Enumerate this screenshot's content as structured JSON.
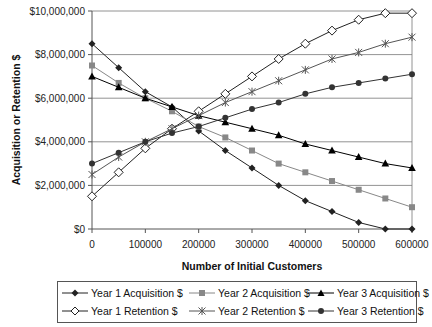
{
  "chart_data": {
    "type": "line",
    "title": "",
    "xlabel": "Number of Initial Customers",
    "ylabel": "Acquisition or Retention $",
    "x": [
      0,
      50000,
      100000,
      150000,
      200000,
      250000,
      300000,
      350000,
      400000,
      450000,
      500000,
      550000,
      600000
    ],
    "x_tick_labels": [
      "0",
      "100000",
      "200000",
      "300000",
      "400000",
      "500000",
      "600000"
    ],
    "y_tick_labels": [
      "$0",
      "$2,000,000",
      "$4,000,000",
      "$6,000,000",
      "$8,000,000",
      "$10,000,000"
    ],
    "ylim": [
      0,
      10000000
    ],
    "xlim": [
      0,
      600000
    ],
    "grid": "horizontal",
    "legend_position": "bottom",
    "series": [
      {
        "name": "Year 1 Acquisition $",
        "marker": "diamond-filled",
        "color": "#222222",
        "values": [
          8500000,
          7400000,
          6300000,
          5600000,
          4500000,
          3600000,
          2800000,
          2000000,
          1300000,
          800000,
          300000,
          0,
          0
        ]
      },
      {
        "name": "Year 2 Acquisition $",
        "marker": "square-gray",
        "color": "#888888",
        "values": [
          7500000,
          6700000,
          6000000,
          5400000,
          4700000,
          4200000,
          3600000,
          3000000,
          2600000,
          2200000,
          1800000,
          1400000,
          1000000
        ]
      },
      {
        "name": "Year 3 Acquisition $",
        "marker": "triangle-filled",
        "color": "#000000",
        "values": [
          7000000,
          6500000,
          6000000,
          5600000,
          5200000,
          4900000,
          4600000,
          4300000,
          3900000,
          3600000,
          3300000,
          3000000,
          2800000
        ]
      },
      {
        "name": "Year 1 Retention $",
        "marker": "diamond-open",
        "color": "#222222",
        "values": [
          1500000,
          2600000,
          3700000,
          4600000,
          5400000,
          6200000,
          7000000,
          7800000,
          8500000,
          9100000,
          9600000,
          9900000,
          9900000
        ]
      },
      {
        "name": "Year 2 Retention $",
        "marker": "asterisk",
        "color": "#555555",
        "values": [
          2500000,
          3300000,
          4000000,
          4600000,
          5200000,
          5800000,
          6300000,
          6800000,
          7300000,
          7800000,
          8100000,
          8500000,
          8800000
        ]
      },
      {
        "name": "Year 3 Retention $",
        "marker": "circle-filled",
        "color": "#333333",
        "values": [
          3000000,
          3500000,
          4000000,
          4400000,
          4700000,
          5100000,
          5500000,
          5800000,
          6200000,
          6500000,
          6700000,
          6900000,
          7100000
        ]
      }
    ]
  },
  "legend": {
    "items": [
      "Year 1 Acquisition $",
      "Year 2 Acquisition $",
      "Year 3 Acquisition $",
      "Year 1 Retention $",
      "Year 2 Retention $",
      "Year 3 Retention $"
    ]
  },
  "axes": {
    "xlabel": "Number of Initial Customers",
    "ylabel": "Acquisition or Retention $"
  }
}
